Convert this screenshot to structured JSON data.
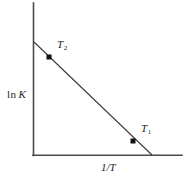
{
  "figure": {
    "width": 190,
    "height": 179,
    "background": "#ffffff",
    "stroke_color": "#3a3a3a",
    "marker_color": "#111111"
  },
  "chart_data": {
    "type": "line",
    "title": "",
    "subtitle": "",
    "xlabel": "1/T",
    "ylabel": "ln K",
    "ylabel_prefix": "ln",
    "ylabel_variable": "K",
    "grid": false,
    "legend": null,
    "axis_ticks": {
      "x": [],
      "y": []
    },
    "xlim": [
      0,
      1
    ],
    "ylim": [
      0,
      1
    ],
    "series": [
      {
        "name": "van't Hoff line",
        "type": "line",
        "x": [
          0.007,
          0.8
        ],
        "y": [
          1.0,
          0.0
        ],
        "style": "solid"
      }
    ],
    "points": [
      {
        "label": "T",
        "subscript": "2",
        "x": 0.107,
        "y": 0.867,
        "marker": "square",
        "label_position": "upper-right"
      },
      {
        "label": "T",
        "subscript": "1",
        "x": 0.671,
        "y": 0.124,
        "marker": "square",
        "label_position": "upper-right"
      }
    ],
    "annotations": []
  },
  "geometry": {
    "y_axis": {
      "x": 33,
      "y_top": 3,
      "y_bottom": 155
    },
    "x_axis": {
      "y": 155,
      "x_left": 33,
      "x_right": 182
    },
    "trend_line": {
      "x1": 34,
      "y1": 42,
      "x2": 152,
      "y2": 155
    },
    "marker_t2": {
      "cx": 49,
      "cy": 57,
      "size": 5
    },
    "marker_t1": {
      "cx": 133,
      "cy": 141,
      "size": 5
    }
  }
}
